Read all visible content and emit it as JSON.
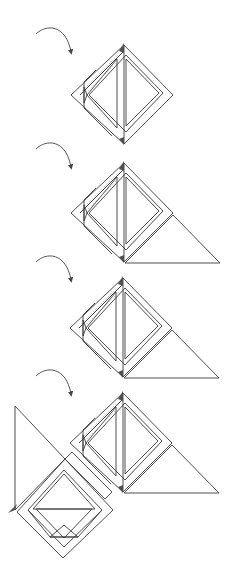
{
  "diagram": {
    "type": "quilt-block-assembly-steps",
    "colors": {
      "background": "#ffffff",
      "outline": "#3a3a3a",
      "dark_triangle": "#606060",
      "light_triangle": "#c2c2c2",
      "strip": "#fbfbfb",
      "floral_base": "#ececec",
      "floral_spots": "#9c9c9c",
      "check_dark": "#6a6a6a",
      "check_light": "#b4b4b4",
      "arrow": "#444444"
    },
    "steps": [
      {
        "index": 1,
        "arrow": "rotate-clockwise",
        "has_large_triangle": false
      },
      {
        "index": 2,
        "arrow": "rotate-clockwise",
        "has_large_triangle": true
      },
      {
        "index": 3,
        "arrow": "rotate-clockwise",
        "has_large_triangle": true
      },
      {
        "index": 4,
        "arrow": "rotate-clockwise",
        "has_large_triangle": true,
        "joined_with": "basket-block"
      }
    ]
  }
}
